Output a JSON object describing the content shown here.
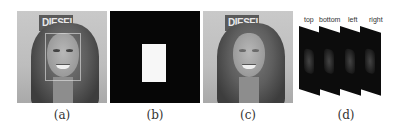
{
  "figure": {
    "panels": [
      {
        "id": "a",
        "caption": "(a)",
        "content": "face-photo-with-bounding-box",
        "sign_text": "DIESEL"
      },
      {
        "id": "b",
        "caption": "(b)",
        "content": "binary-mask-white-rectangle-on-black"
      },
      {
        "id": "c",
        "caption": "(c)",
        "content": "face-photo-with-blurred-region",
        "sign_text": "DIESEL"
      },
      {
        "id": "d",
        "caption": "(d)",
        "content": "stacked-directional-maps",
        "frames": [
          {
            "label": "top"
          },
          {
            "label": "bottom"
          },
          {
            "label": "left"
          },
          {
            "label": "right"
          }
        ]
      }
    ]
  },
  "colors": {
    "background": "#ffffff",
    "mask_black": "#060606",
    "mask_white": "#f7f7f7",
    "frame_black": "#0c0c0c"
  }
}
